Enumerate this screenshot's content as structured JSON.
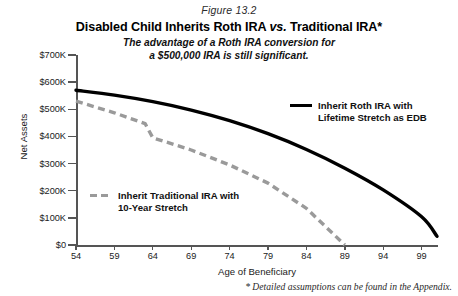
{
  "figure": {
    "number": "Figure 13.2",
    "title_part1": "Disabled Child Inherits Roth IRA ",
    "title_emphasis": "vs.",
    "title_part2": " Traditional IRA*",
    "subtitle_line1": "The advantage of a Roth IRA conversion for",
    "subtitle_line2": "a $500,000 IRA is still significant.",
    "footnote": "* Detailed assumptions can be found in the Appendix."
  },
  "legend": {
    "roth_line1": "Inherit Roth IRA with",
    "roth_line2": "Lifetime Stretch as EDB",
    "trad_line1": "Inherit Traditional IRA with",
    "trad_line2": "10-Year Stretch"
  },
  "colors": {
    "roth_series": "#000000",
    "traditional_series": "#9a9a9a",
    "axis": "#555555",
    "text": "#1a1a1a",
    "background": "#ffffff"
  },
  "chart_data": {
    "type": "line",
    "title": "Disabled Child Inherits Roth IRA vs. Traditional IRA*",
    "subtitle": "The advantage of a Roth IRA conversion for a $500,000 IRA is still significant.",
    "xlabel": "Age of Beneficiary",
    "ylabel": "Net Assets",
    "xlim": [
      54,
      101
    ],
    "ylim": [
      0,
      700000
    ],
    "xticks": [
      54,
      59,
      64,
      69,
      74,
      79,
      84,
      89,
      94,
      99
    ],
    "xticklabels": [
      "54",
      "59",
      "64",
      "69",
      "74",
      "79",
      "84",
      "89",
      "94",
      "99"
    ],
    "yticks": [
      0,
      100000,
      200000,
      300000,
      400000,
      500000,
      600000,
      700000
    ],
    "yticklabels": [
      "$0",
      "$100K",
      "$200K",
      "$300K",
      "$400K",
      "$500K",
      "$600K",
      "$700K"
    ],
    "grid": false,
    "legend_position": "inside",
    "series": [
      {
        "name": "Inherit Roth IRA with Lifetime Stretch as EDB",
        "color": "#000000",
        "style": "solid",
        "x": [
          54,
          59,
          64,
          69,
          74,
          79,
          84,
          89,
          94,
          99,
          101
        ],
        "values": [
          570000,
          552000,
          528000,
          497000,
          458000,
          410000,
          352000,
          283000,
          203000,
          104000,
          32000
        ]
      },
      {
        "name": "Inherit Traditional IRA with 10-Year Stretch",
        "color": "#9a9a9a",
        "style": "dashed",
        "x": [
          54,
          59,
          63,
          64,
          69,
          74,
          79,
          84,
          89
        ],
        "values": [
          530000,
          487000,
          447000,
          395000,
          350000,
          295000,
          228000,
          135000,
          0
        ]
      }
    ]
  }
}
